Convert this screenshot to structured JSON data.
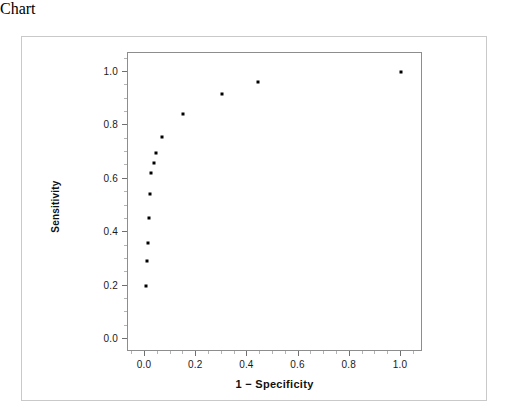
{
  "chart_data": {
    "type": "scatter",
    "title": "",
    "xlabel": "1 − Specificity",
    "ylabel": "Sensitivity",
    "xlim": [
      -0.07,
      1.09
    ],
    "ylim": [
      -0.07,
      1.1
    ],
    "grid": false,
    "legend": null,
    "marker": {
      "shape": "square",
      "color": "#000000",
      "size_px": 3
    },
    "xticks": [
      {
        "value": 0.0,
        "label": "0.0"
      },
      {
        "value": 0.2,
        "label": "0.2"
      },
      {
        "value": 0.4,
        "label": "0.4"
      },
      {
        "value": 0.6,
        "label": "0.6"
      },
      {
        "value": 0.8,
        "label": "0.8"
      },
      {
        "value": 1.0,
        "label": "1.0"
      }
    ],
    "yticks": [
      {
        "value": 0.0,
        "label": "0.0"
      },
      {
        "value": 0.2,
        "label": "0.2"
      },
      {
        "value": 0.4,
        "label": "0.4"
      },
      {
        "value": 0.6,
        "label": "0.6"
      },
      {
        "value": 0.8,
        "label": "0.8"
      },
      {
        "value": 1.0,
        "label": "1.0"
      }
    ],
    "points": [
      {
        "x": 0.004,
        "y": 0.199
      },
      {
        "x": 0.008,
        "y": 0.293
      },
      {
        "x": 0.012,
        "y": 0.36
      },
      {
        "x": 0.016,
        "y": 0.454
      },
      {
        "x": 0.02,
        "y": 0.544
      },
      {
        "x": 0.023,
        "y": 0.622
      },
      {
        "x": 0.035,
        "y": 0.66
      },
      {
        "x": 0.043,
        "y": 0.697
      },
      {
        "x": 0.066,
        "y": 0.757
      },
      {
        "x": 0.148,
        "y": 0.843
      },
      {
        "x": 0.301,
        "y": 0.918
      },
      {
        "x": 0.441,
        "y": 0.963
      },
      {
        "x": 1.0,
        "y": 1.0
      }
    ]
  },
  "figure": {
    "panel_border_color": "#8d8d8d",
    "card_border_color": "#c9c9c9",
    "background_color": "#ffffff",
    "axis_text_color": "#1a1a1a"
  }
}
